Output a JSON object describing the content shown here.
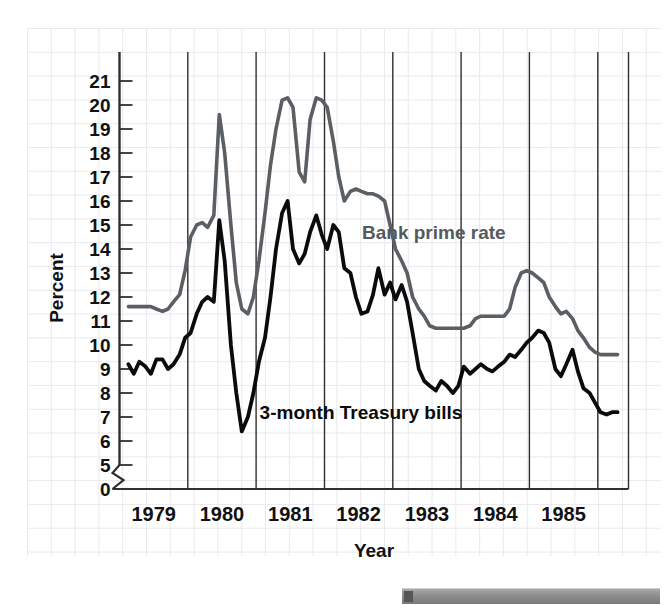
{
  "chart_data": {
    "type": "line",
    "title": "",
    "xlabel": "Year",
    "ylabel": "Percent",
    "ylim": [
      5,
      21
    ],
    "y_axis_break": true,
    "y_axis_break_label": "0",
    "yticks": [
      5,
      6,
      7,
      8,
      9,
      10,
      11,
      12,
      13,
      14,
      15,
      16,
      17,
      18,
      19,
      20,
      21
    ],
    "xlim": [
      1978.5,
      1985.95
    ],
    "xticks": [
      1979,
      1980,
      1981,
      1982,
      1983,
      1984,
      1985
    ],
    "xtick_labels": [
      "1979",
      "1980",
      "1981",
      "1982",
      "1983",
      "1984",
      "1985"
    ],
    "grid": true,
    "legend": "inline-annotations",
    "series": [
      {
        "name": "Bank prime rate",
        "color": "#5a5f63",
        "label_position": {
          "x": 1982.05,
          "y": 14.4
        },
        "x": [
          1978.63,
          1978.71,
          1978.79,
          1978.88,
          1978.96,
          1979.04,
          1979.13,
          1979.21,
          1979.29,
          1979.38,
          1979.46,
          1979.54,
          1979.63,
          1979.71,
          1979.79,
          1979.88,
          1979.96,
          1980.04,
          1980.13,
          1980.21,
          1980.29,
          1980.38,
          1980.46,
          1980.54,
          1980.63,
          1980.71,
          1980.79,
          1980.88,
          1980.96,
          1981.04,
          1981.13,
          1981.21,
          1981.29,
          1981.38,
          1981.46,
          1981.54,
          1981.63,
          1981.71,
          1981.79,
          1981.88,
          1981.96,
          1982.04,
          1982.13,
          1982.21,
          1982.29,
          1982.38,
          1982.46,
          1982.54,
          1982.63,
          1982.71,
          1982.79,
          1982.88,
          1982.96,
          1983.04,
          1983.13,
          1983.21,
          1983.29,
          1983.38,
          1983.46,
          1983.54,
          1983.63,
          1983.71,
          1983.79,
          1983.88,
          1983.96,
          1984.04,
          1984.13,
          1984.21,
          1984.29,
          1984.38,
          1984.46,
          1984.54,
          1984.63,
          1984.71,
          1984.79,
          1984.88,
          1984.96,
          1985.04,
          1985.13,
          1985.21,
          1985.29,
          1985.38,
          1985.46,
          1985.54,
          1985.63,
          1985.71,
          1985.79
        ],
        "y": [
          11.6,
          11.6,
          11.6,
          11.6,
          11.6,
          11.5,
          11.4,
          11.5,
          11.8,
          12.1,
          13.1,
          14.5,
          15.0,
          15.1,
          14.9,
          15.4,
          19.6,
          18.0,
          15.0,
          12.6,
          11.5,
          11.3,
          12.0,
          13.5,
          15.5,
          17.5,
          19.0,
          20.2,
          20.3,
          19.9,
          17.2,
          16.8,
          19.4,
          20.3,
          20.2,
          19.9,
          18.5,
          17.0,
          16.0,
          16.4,
          16.5,
          16.4,
          16.3,
          16.3,
          16.2,
          16.0,
          15.0,
          14.0,
          13.5,
          13.0,
          12.0,
          11.5,
          11.2,
          10.8,
          10.7,
          10.7,
          10.7,
          10.7,
          10.7,
          10.7,
          10.8,
          11.1,
          11.2,
          11.2,
          11.2,
          11.2,
          11.2,
          11.5,
          12.4,
          13.0,
          13.1,
          13.0,
          12.8,
          12.6,
          12.0,
          11.6,
          11.3,
          11.4,
          11.1,
          10.6,
          10.3,
          9.9,
          9.7,
          9.6,
          9.6,
          9.6,
          9.6
        ]
      },
      {
        "name": "3-month Treasury bills",
        "color": "#0b0b0b",
        "label_position": {
          "x": 1980.55,
          "y": 6.9
        },
        "x": [
          1978.63,
          1978.71,
          1978.79,
          1978.88,
          1978.96,
          1979.04,
          1979.13,
          1979.21,
          1979.29,
          1979.38,
          1979.46,
          1979.54,
          1979.63,
          1979.71,
          1979.79,
          1979.88,
          1979.96,
          1980.04,
          1980.13,
          1980.21,
          1980.29,
          1980.38,
          1980.46,
          1980.54,
          1980.63,
          1980.71,
          1980.79,
          1980.88,
          1980.96,
          1981.04,
          1981.13,
          1981.21,
          1981.29,
          1981.38,
          1981.46,
          1981.54,
          1981.63,
          1981.71,
          1981.79,
          1981.88,
          1981.96,
          1982.04,
          1982.13,
          1982.21,
          1982.29,
          1982.38,
          1982.46,
          1982.54,
          1982.63,
          1982.71,
          1982.79,
          1982.88,
          1982.96,
          1983.04,
          1983.13,
          1983.21,
          1983.29,
          1983.38,
          1983.46,
          1983.54,
          1983.63,
          1983.71,
          1983.79,
          1983.88,
          1983.96,
          1984.04,
          1984.13,
          1984.21,
          1984.29,
          1984.38,
          1984.46,
          1984.54,
          1984.63,
          1984.71,
          1984.79,
          1984.88,
          1984.96,
          1985.04,
          1985.13,
          1985.21,
          1985.29,
          1985.38,
          1985.46,
          1985.54,
          1985.63,
          1985.71,
          1985.79
        ],
        "y": [
          9.2,
          8.8,
          9.3,
          9.1,
          8.8,
          9.4,
          9.4,
          9.0,
          9.2,
          9.6,
          10.3,
          10.5,
          11.3,
          11.8,
          12.0,
          11.8,
          15.2,
          13.5,
          10.0,
          8.0,
          6.4,
          7.0,
          8.0,
          9.3,
          10.3,
          12.0,
          14.0,
          15.5,
          16.0,
          14.0,
          13.4,
          13.8,
          14.7,
          15.4,
          14.6,
          14.0,
          15.0,
          14.7,
          13.2,
          13.0,
          12.0,
          11.3,
          11.4,
          12.1,
          13.2,
          12.1,
          12.6,
          11.9,
          12.5,
          11.8,
          10.5,
          9.0,
          8.5,
          8.3,
          8.1,
          8.5,
          8.3,
          8.0,
          8.3,
          9.1,
          8.8,
          9.0,
          9.2,
          9.0,
          8.9,
          9.1,
          9.3,
          9.6,
          9.5,
          9.8,
          10.1,
          10.3,
          10.6,
          10.5,
          10.1,
          9.0,
          8.7,
          9.2,
          9.8,
          8.9,
          8.2,
          8.0,
          7.6,
          7.2,
          7.1,
          7.2,
          7.2
        ]
      }
    ]
  },
  "annotations": {
    "prime_label": "Bank prime rate",
    "tbill_label": "3-month Treasury bills",
    "y_axis_title": "Percent",
    "x_axis_title": "Year",
    "zero_label": "0"
  }
}
